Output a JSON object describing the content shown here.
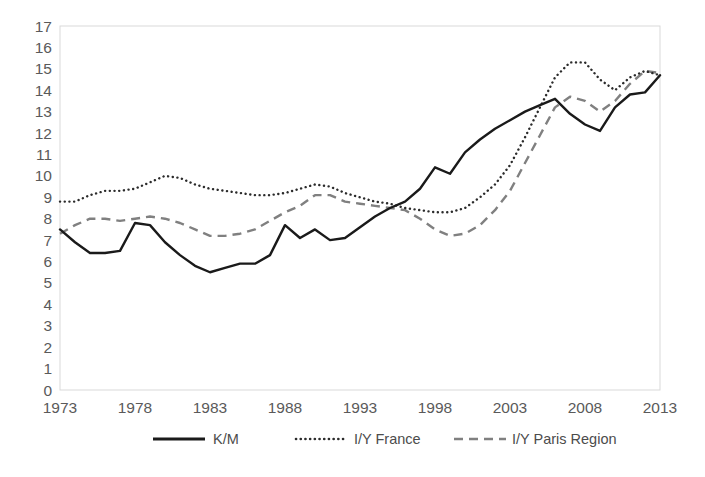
{
  "chart_data": {
    "type": "line",
    "title": "",
    "xlabel": "",
    "ylabel": "",
    "xlim": [
      1973,
      2013
    ],
    "ylim": [
      0,
      17
    ],
    "grid": false,
    "legend_position": "bottom",
    "x_tick_labels": [
      "1973",
      "1978",
      "1983",
      "1988",
      "1993",
      "1998",
      "2003",
      "2008",
      "2013"
    ],
    "x_ticks": [
      1973,
      1978,
      1983,
      1988,
      1993,
      1998,
      2003,
      2008,
      2013
    ],
    "y_tick_labels": [
      "0",
      "1",
      "2",
      "3",
      "4",
      "5",
      "6",
      "7",
      "8",
      "9",
      "10",
      "11",
      "12",
      "13",
      "14",
      "15",
      "16",
      "17"
    ],
    "y_ticks": [
      0,
      1,
      2,
      3,
      4,
      5,
      6,
      7,
      8,
      9,
      10,
      11,
      12,
      13,
      14,
      15,
      16,
      17
    ],
    "x": [
      1973,
      1974,
      1975,
      1976,
      1977,
      1978,
      1979,
      1980,
      1981,
      1982,
      1983,
      1984,
      1985,
      1986,
      1987,
      1988,
      1989,
      1990,
      1991,
      1992,
      1993,
      1994,
      1995,
      1996,
      1997,
      1998,
      1999,
      2000,
      2001,
      2002,
      2003,
      2004,
      2005,
      2006,
      2007,
      2008,
      2009,
      2010,
      2011,
      2012,
      2013
    ],
    "series": [
      {
        "name": "K/M",
        "style": "solid",
        "color": "#1a1a1a",
        "values": [
          7.5,
          6.9,
          6.4,
          6.4,
          6.5,
          7.8,
          7.7,
          6.9,
          6.3,
          5.8,
          5.5,
          5.7,
          5.9,
          5.9,
          6.3,
          7.7,
          7.1,
          7.5,
          7.0,
          7.1,
          7.6,
          8.1,
          8.5,
          8.8,
          9.4,
          10.4,
          10.1,
          11.1,
          11.7,
          12.2,
          12.6,
          13.0,
          13.3,
          13.6,
          12.9,
          12.4,
          12.1,
          13.2,
          13.8,
          13.9,
          14.7
        ]
      },
      {
        "name": "I/Y France",
        "style": "dotted",
        "color": "#2b2b2b",
        "values": [
          8.8,
          8.8,
          9.1,
          9.3,
          9.3,
          9.4,
          9.7,
          10.0,
          9.9,
          9.6,
          9.4,
          9.3,
          9.2,
          9.1,
          9.1,
          9.2,
          9.4,
          9.6,
          9.5,
          9.2,
          9.0,
          8.8,
          8.7,
          8.5,
          8.4,
          8.3,
          8.3,
          8.5,
          9.0,
          9.6,
          10.5,
          11.8,
          13.2,
          14.6,
          15.3,
          15.3,
          14.5,
          14.0,
          14.6,
          14.9,
          14.7
        ]
      },
      {
        "name": "I/Y Paris Region",
        "style": "dashed",
        "color": "#808080",
        "values": [
          7.3,
          7.7,
          8.0,
          8.0,
          7.9,
          8.0,
          8.1,
          8.0,
          7.8,
          7.5,
          7.2,
          7.2,
          7.3,
          7.5,
          7.9,
          8.3,
          8.6,
          9.1,
          9.1,
          8.8,
          8.7,
          8.6,
          8.5,
          8.4,
          8.0,
          7.5,
          7.2,
          7.3,
          7.7,
          8.4,
          9.3,
          10.6,
          11.9,
          13.2,
          13.7,
          13.5,
          13.0,
          13.5,
          14.3,
          14.9,
          14.8
        ]
      }
    ],
    "legend": [
      {
        "label": "K/M",
        "style": "solid"
      },
      {
        "label": "I/Y France",
        "style": "dotted"
      },
      {
        "label": "I/Y Paris Region",
        "style": "dashed"
      }
    ]
  }
}
